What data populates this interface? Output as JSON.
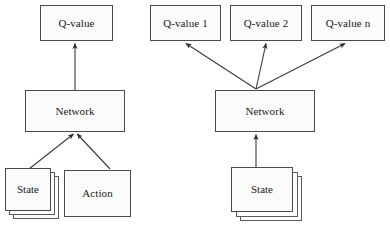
{
  "figure": {
    "title": "",
    "background_color": "#ffffff",
    "line_color": "#3a3a3a",
    "box_fill": "#fbfbfb",
    "box_border": "#4a4a4a"
  },
  "left_diagram": {
    "name": "single-q-value-network",
    "output": {
      "label": "Q-value"
    },
    "network": {
      "label": "Network"
    },
    "inputs": [
      {
        "label": "State",
        "stacked": true
      },
      {
        "label": "Action",
        "stacked": false
      }
    ]
  },
  "right_diagram": {
    "name": "multi-q-value-network",
    "outputs": [
      {
        "label": "Q-value 1"
      },
      {
        "label": "Q-value 2"
      },
      {
        "label": "Q-value n"
      }
    ],
    "network": {
      "label": "Network"
    },
    "inputs": [
      {
        "label": "State",
        "stacked": true
      }
    ]
  },
  "edges": {
    "left": [
      {
        "from": "State",
        "to": "Network",
        "arrow": true
      },
      {
        "from": "Action",
        "to": "Network",
        "arrow": true
      },
      {
        "from": "Network",
        "to": "Q-value",
        "arrow": true
      }
    ],
    "right": [
      {
        "from": "State",
        "to": "Network",
        "arrow": true
      },
      {
        "from": "Network",
        "to": "Q-value 1",
        "arrow": true
      },
      {
        "from": "Network",
        "to": "Q-value 2",
        "arrow": true
      },
      {
        "from": "Network",
        "to": "Q-value n",
        "arrow": true
      }
    ]
  }
}
